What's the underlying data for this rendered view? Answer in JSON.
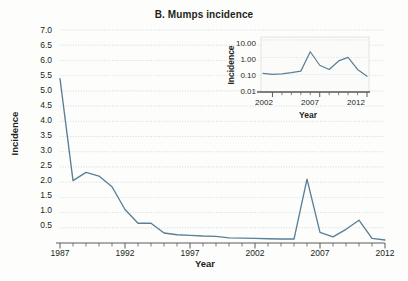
{
  "figure": {
    "panel_letter": "B.",
    "title": "B.  Mumps incidence",
    "background_color": "#fdfdfc",
    "line_color": "#5b7f95",
    "grid_color": "#b9cdd8",
    "axis_color": "#5a5a5a",
    "text_color": "#231f20"
  },
  "main_chart": {
    "ylabel": "Incidence",
    "xlabel": "Year",
    "ytick_labels": [
      "7.0",
      "6.5",
      "6.0",
      "5.5",
      "5.0",
      "4.5",
      "4.0",
      "3.5",
      "3.0",
      "2.5",
      "2.0",
      "1.5",
      "1.0",
      "0.5"
    ],
    "xtick_labels": [
      "1987",
      "1992",
      "1997",
      "2002",
      "2007",
      "2012"
    ]
  },
  "inset_chart": {
    "ylabel": "Incidence",
    "xlabel": "Year",
    "ytick_labels": [
      "10.00",
      "1.00",
      "0.10",
      "0.01"
    ],
    "xtick_labels": [
      "2002",
      "2007",
      "2012"
    ]
  },
  "chart_data": [
    {
      "id": "main",
      "type": "line",
      "title": "B.  Mumps incidence",
      "xlabel": "Year",
      "ylabel": "Incidence",
      "scale": "linear",
      "grid": true,
      "legend": null,
      "xlim": [
        1987,
        2012
      ],
      "ylim": [
        0,
        7.0
      ],
      "ytick_values": [
        0.5,
        1.0,
        1.5,
        2.0,
        2.5,
        3.0,
        3.5,
        4.0,
        4.5,
        5.0,
        5.5,
        6.0,
        6.5,
        7.0
      ],
      "xtick_values": [
        1987,
        1992,
        1997,
        2002,
        2007,
        2012
      ],
      "xtick_labeled": [
        1987,
        1992,
        1997,
        2002,
        2007,
        2012
      ],
      "x": [
        1987,
        1988,
        1989,
        1990,
        1991,
        1992,
        1993,
        1994,
        1995,
        1996,
        1997,
        1998,
        1999,
        2000,
        2001,
        2002,
        2003,
        2004,
        2005,
        2006,
        2007,
        2008,
        2009,
        2010,
        2011,
        2012
      ],
      "series": [
        {
          "name": "Mumps incidence",
          "color": "#5b7f95",
          "values": [
            5.4,
            2.05,
            2.32,
            2.2,
            1.85,
            1.1,
            0.65,
            0.65,
            0.33,
            0.27,
            0.25,
            0.23,
            0.22,
            0.17,
            0.16,
            0.15,
            0.14,
            0.13,
            0.13,
            2.1,
            0.35,
            0.2,
            0.45,
            0.75,
            0.15,
            0.1
          ]
        }
      ]
    },
    {
      "id": "inset",
      "type": "line",
      "title": "",
      "xlabel": "Year",
      "ylabel": "Incidence",
      "scale": "log",
      "grid": true,
      "legend": null,
      "xlim": [
        2001,
        2012
      ],
      "ylim": [
        0.01,
        10.0
      ],
      "ytick_values": [
        0.01,
        0.1,
        1.0,
        10.0
      ],
      "xtick_values": [
        2002,
        2003,
        2004,
        2005,
        2006,
        2007,
        2008,
        2009,
        2010,
        2011,
        2012
      ],
      "xtick_labeled": [
        2002,
        2007,
        2012
      ],
      "x": [
        2001,
        2002,
        2003,
        2004,
        2005,
        2006,
        2007,
        2008,
        2009,
        2010,
        2011,
        2012
      ],
      "series": [
        {
          "name": "Mumps incidence (log)",
          "color": "#5b7f95",
          "values": [
            0.12,
            0.105,
            0.11,
            0.13,
            0.16,
            2.1,
            0.35,
            0.2,
            0.62,
            1.0,
            0.2,
            0.08
          ]
        }
      ]
    }
  ]
}
